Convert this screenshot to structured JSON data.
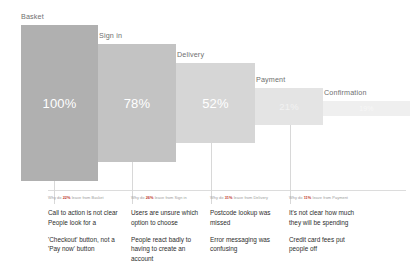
{
  "chart_data": {
    "type": "bar",
    "title": "",
    "xlabel": "",
    "ylabel": "",
    "ylim": [
      0,
      100
    ],
    "categories": [
      "Basket",
      "Sign in",
      "Delivery",
      "Payment",
      "Confirmation"
    ],
    "values": [
      100,
      78,
      52,
      21,
      19
    ],
    "value_labels": [
      "100%",
      "78%",
      "52%",
      "21%",
      "19%"
    ],
    "series": [
      {
        "name": "Checkout funnel completion",
        "values": [
          100,
          78,
          52,
          21,
          19
        ]
      }
    ],
    "bar_colors": [
      "#b0b0b0",
      "#c3c3c3",
      "#d6d6d6",
      "#e4e4e4",
      "#efefef"
    ],
    "grid": false,
    "legend": "none"
  },
  "stages": [
    {
      "label": "Basket",
      "value_label": "100%"
    },
    {
      "label": "Sign in",
      "value_label": "78%"
    },
    {
      "label": "Delivery",
      "value_label": "52%"
    },
    {
      "label": "Payment",
      "value_label": "21%"
    },
    {
      "label": "Confirmation",
      "value_label": "19%"
    }
  ],
  "notes": [
    {
      "head_prefix": "Why do ",
      "head_pct": "22%",
      "head_suffix": " leave from Basket",
      "items": [
        "Call to action is not clear\nPeople look for a",
        "'Checkout' button, not a\n'Pay now' button"
      ]
    },
    {
      "head_prefix": "Why do ",
      "head_pct": "26%",
      "head_suffix": " leave from Sign in",
      "items": [
        "Users are unsure which\noption to choose",
        "People react badly to\nhaving to create an\naccount"
      ]
    },
    {
      "head_prefix": "Why do ",
      "head_pct": "31%",
      "head_suffix": " leave from Delivery",
      "items": [
        "Postcode lookup was\nmissed",
        "Error messaging was\nconfusing"
      ]
    },
    {
      "head_prefix": "Why do ",
      "head_pct": "11%",
      "head_suffix": " leave from Payment",
      "items": [
        "It's not clear how much\nthey will be spending",
        "Credit card fees put\npeople off"
      ]
    }
  ]
}
